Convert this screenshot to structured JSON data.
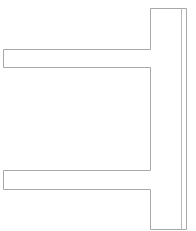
{
  "canvas": {
    "width": 196,
    "height": 231,
    "background": "#ffffff"
  },
  "shape": {
    "name": "double-arm-bracket-outline",
    "stroke": "#a8a8a8",
    "stroke_width": 1,
    "outline_points": [
      [
        150,
        8
      ],
      [
        186,
        8
      ],
      [
        186,
        229
      ],
      [
        150,
        229
      ],
      [
        150,
        189
      ],
      [
        3,
        189
      ],
      [
        3,
        170
      ],
      [
        150,
        170
      ],
      [
        150,
        67
      ],
      [
        3,
        67
      ],
      [
        3,
        49
      ],
      [
        150,
        49
      ]
    ],
    "inner_line": {
      "x": 181,
      "y1": 8,
      "y2": 229,
      "stroke": "#b8b8b8"
    }
  }
}
